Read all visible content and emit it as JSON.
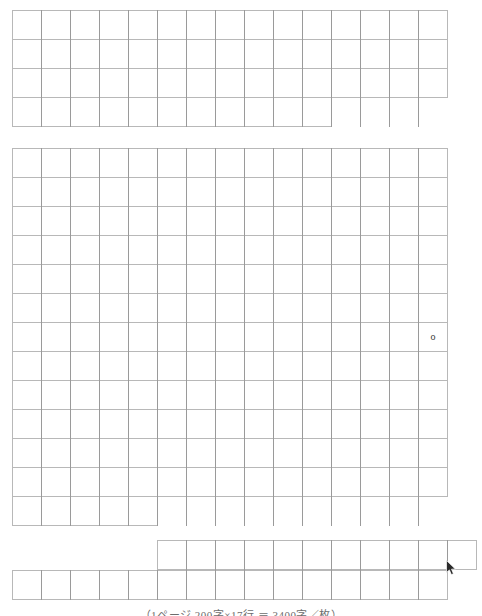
{
  "document": {
    "kind": "grid-writing-sheet",
    "title": "",
    "paper_color": "#ffffff",
    "grid_line_color": "#b8b8b8",
    "column_rule_color": "#9a9a9a",
    "cell_size_px": 29,
    "total_columns": 15,
    "blocks": [
      {
        "id": "block-1",
        "x": 12,
        "y": 10,
        "cells": 15,
        "rows": 4,
        "last_row_cells": 11
      },
      {
        "id": "block-2",
        "x": 12,
        "y": 148,
        "cells": 15,
        "rows": 13,
        "last_row_cells": 5
      },
      {
        "id": "block-3",
        "x": 157,
        "y": 540,
        "cells": 11,
        "rows": 1
      },
      {
        "id": "block-4",
        "x": 12,
        "y": 570,
        "cells": 15,
        "rows": 1
      }
    ]
  },
  "content": {
    "typed_characters": [
      {
        "text": "o",
        "block": "block-2",
        "row": 7,
        "column": 15
      }
    ]
  },
  "cursor": {
    "name": "mouse-pointer",
    "x": 446,
    "y": 560,
    "visible": true
  },
  "caption": {
    "text": "（1ページ 200字×17行 ＝ 3400字／枚）",
    "visible_fraction": "clipped-at-bottom-edge",
    "top": 606,
    "height": 10,
    "color": "#6d6d6d"
  }
}
